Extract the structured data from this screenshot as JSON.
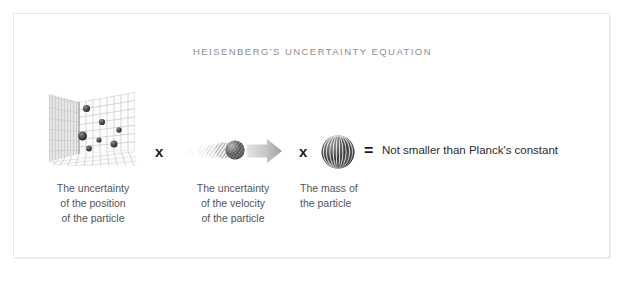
{
  "figure": {
    "title": "HEISENBERG'S UNCERTAINTY EQUATION",
    "background_color": "#ffffff",
    "frame_color": "#e8e8e8",
    "title_color": "#8e8e8e",
    "caption_color": "#555555",
    "operator_color": "#1a1a1a"
  },
  "equation": {
    "operator_times_1": "x",
    "operator_times_2": "x",
    "operator_equals": "=",
    "result_text": "Not smaller than Planck's constant"
  },
  "panels": [
    {
      "id": "position",
      "illustration": "perspective-grid-with-particles",
      "caption_lines": [
        "The uncertainty",
        "of the position",
        "of the particle"
      ]
    },
    {
      "id": "velocity",
      "illustration": "motion-blur-spheres-with-arrow",
      "caption_lines": [
        "The uncertainty",
        "of the velocity",
        "of the particle"
      ]
    },
    {
      "id": "mass",
      "illustration": "striped-sphere",
      "caption_lines": [
        "The mass of",
        "the particle"
      ]
    }
  ]
}
